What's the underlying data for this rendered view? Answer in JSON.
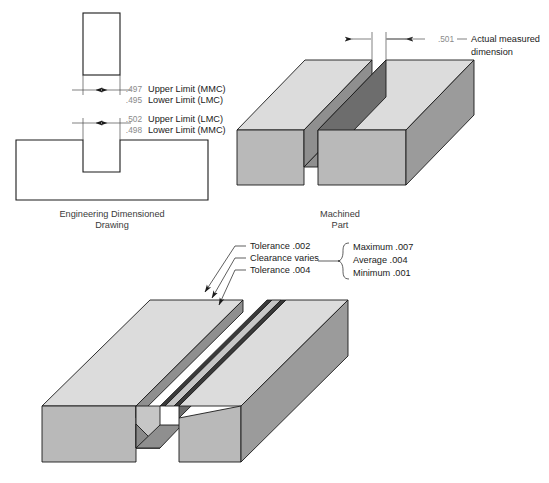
{
  "figure": {
    "title_semantic": "mmc-lmc-tolerance-clearance-illustration",
    "panels": {
      "engineering_drawing": {
        "caption_line1": "Engineering Dimensioned",
        "caption_line2": "Drawing",
        "tab": {
          "dims": [
            {
              "value": ".497",
              "label": "Upper Limit (MMC)"
            },
            {
              "value": ".495",
              "label": "Lower Limit (LMC)"
            }
          ]
        },
        "slot": {
          "dims": [
            {
              "value": ".502",
              "label": "Upper Limit (LMC)"
            },
            {
              "value": ".498",
              "label": "Lower Limit (MMC)"
            }
          ]
        }
      },
      "machined_part": {
        "caption_line1": "Machined",
        "caption_line2": "Part",
        "dim_value": ".501",
        "dim_label_line1": "Actual measured",
        "dim_label_line2": "dimension"
      },
      "assembly": {
        "callouts": [
          "Tolerance .002",
          "Clearance varies",
          "Tolerance .004"
        ],
        "brace_items": [
          "Maximum .007",
          "Average .004",
          "Minimum .001"
        ]
      }
    },
    "colors": {
      "top_face": "#dcdcdc",
      "front_face": "#b9b9b9",
      "side_face": "#9b9b9b",
      "slot_face": "#8f8f8f",
      "slot_deep": "#3a3a3a",
      "outline": "#1a1a1a",
      "dim_text": "#8a8a8a"
    }
  }
}
